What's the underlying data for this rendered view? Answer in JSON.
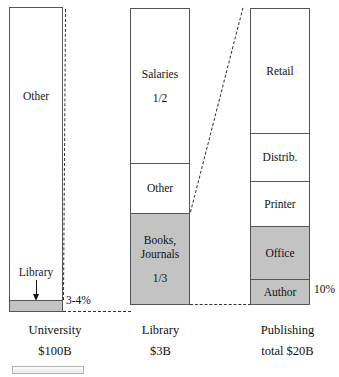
{
  "chart_data": {
    "type": "bar",
    "title": "",
    "xlabel": "",
    "ylabel": "",
    "grid": false,
    "legend": "none",
    "note": "Three stacked proportional bars linked by dashed magnification connectors, showing how university budget flows to library budget and then to publishing revenue.",
    "categories": [
      "University",
      "Library",
      "Publishing"
    ],
    "series": [
      {
        "name": "University",
        "total_label": "$100B",
        "segments": [
          {
            "label": "Other",
            "share": 0.965,
            "shaded": false
          },
          {
            "label": "Library",
            "share": 0.035,
            "shaded": true,
            "annotation": "3-4%"
          }
        ]
      },
      {
        "name": "Library",
        "total_label": "$3B",
        "segments": [
          {
            "label": "Salaries",
            "fraction_label": "1/2",
            "share": 0.5,
            "shaded": false
          },
          {
            "label": "Other",
            "fraction_label": "",
            "share": 0.17,
            "shaded": false
          },
          {
            "label": "Books, Journals",
            "fraction_label": "1/3",
            "share": 0.33,
            "shaded": true
          }
        ]
      },
      {
        "name": "Publishing",
        "total_label": "total $20B",
        "segments": [
          {
            "label": "Retail",
            "share": 0.42,
            "shaded": false
          },
          {
            "label": "Distrib.",
            "share": 0.16,
            "shaded": false
          },
          {
            "label": "Printer",
            "share": 0.15,
            "shaded": false
          },
          {
            "label": "Office",
            "share": 0.18,
            "shaded": true
          },
          {
            "label": "Author",
            "share": 0.09,
            "shaded": true,
            "annotation": "10%"
          }
        ]
      }
    ]
  },
  "bars": {
    "university": {
      "other_label": "Other",
      "callout_label": "Library",
      "pct_annotation": "3-4%"
    },
    "library": {
      "salaries_label": "Salaries",
      "salaries_fraction": "1/2",
      "other_label": "Other",
      "books_label_line1": "Books,",
      "books_label_line2": "Journals",
      "books_fraction": "1/3"
    },
    "publishing": {
      "retail_label": "Retail",
      "distrib_label": "Distrib.",
      "printer_label": "Printer",
      "office_label": "Office",
      "author_label": "Author",
      "pct_annotation": "10%"
    }
  },
  "captions": {
    "university_name": "University",
    "university_total": "$100B",
    "library_name": "Library",
    "library_total": "$3B",
    "publishing_name": "Publishing",
    "publishing_total": "total $20B"
  },
  "colors": {
    "shaded_fill": "#c3c3c3",
    "bar_stroke": "#555555",
    "text": "#111111",
    "background": "#ffffff"
  }
}
